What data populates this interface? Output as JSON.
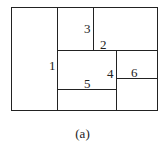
{
  "diagram": {
    "labels": {
      "r1": "1",
      "r2": "2",
      "r3": "3",
      "r4": "4",
      "r5": "5",
      "r6": "6"
    },
    "caption": "(a)"
  }
}
